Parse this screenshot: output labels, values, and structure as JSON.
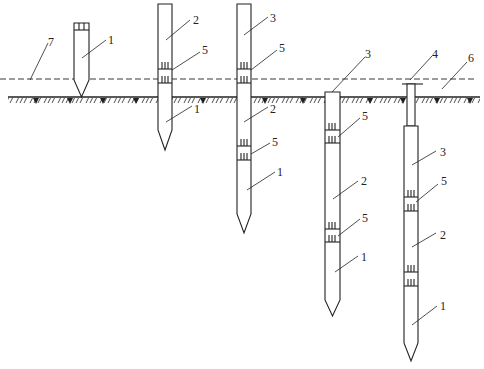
{
  "diagram": {
    "type": "pile-driving-sequence",
    "stroke_color": "#222222",
    "background": "#ffffff",
    "ground_line_y": 97,
    "water_line_y": 79,
    "labels": {
      "pile_section_1": "1",
      "pile_section_2": "2",
      "pile_section_3": "3",
      "follower": "4",
      "joint": "5",
      "ground": "6",
      "water_level": "7"
    },
    "stages": [
      {
        "id": "stage-1",
        "callouts": [
          "1",
          "7"
        ]
      },
      {
        "id": "stage-2",
        "callouts": [
          "2",
          "5",
          "1"
        ]
      },
      {
        "id": "stage-3",
        "callouts": [
          "3",
          "5",
          "2",
          "5",
          "1"
        ]
      },
      {
        "id": "stage-4",
        "callouts": [
          "3",
          "5",
          "2",
          "5",
          "1"
        ]
      },
      {
        "id": "stage-5",
        "callouts": [
          "4",
          "6",
          "3",
          "5",
          "2",
          "1"
        ]
      }
    ]
  }
}
